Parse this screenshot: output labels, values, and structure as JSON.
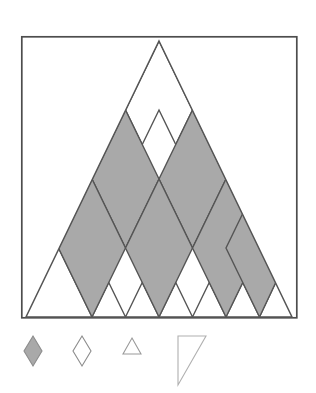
{
  "figure": {
    "type": "geometric-diagram",
    "canvas": {
      "width": 316,
      "height": 393,
      "background": "#ffffff"
    },
    "colors": {
      "shaded_fill": "#a9a9a9",
      "open_fill": "#ffffff",
      "stroke": "#555555",
      "frame_stroke": "#4d4d4d",
      "legend_stroke": "#8c8c8c",
      "legend_shaded_fill": "#a9a9a9"
    },
    "frame": {
      "name": "outer-square-border",
      "x": 21,
      "y": 36,
      "width": 276,
      "height": 282,
      "stroke_width": 1.6
    },
    "triangle": {
      "name": "large-triangle",
      "apex": {
        "x": 159,
        "y": 41
      },
      "base_left": {
        "x": 26,
        "y": 317
      },
      "base_right": {
        "x": 292,
        "y": 317
      },
      "rows": 4,
      "stroke_width": 1.3
    },
    "rows": [
      {
        "index": 1,
        "label": "row-1",
        "cells": [
          {
            "id": "r1c1",
            "kind": "up-triangle",
            "state": "open"
          }
        ]
      },
      {
        "index": 2,
        "label": "row-2",
        "cells": [
          {
            "id": "r2c1",
            "kind": "rhombus",
            "state": "shaded"
          },
          {
            "id": "r2c2",
            "kind": "rhombus",
            "state": "shaded"
          }
        ]
      },
      {
        "index": 3,
        "label": "row-3",
        "cells": [
          {
            "id": "r3c1",
            "kind": "rhombus",
            "state": "open"
          },
          {
            "id": "r3c2",
            "kind": "rhombus",
            "state": "open"
          },
          {
            "id": "r3c3",
            "kind": "rhombus",
            "state": "open"
          }
        ]
      },
      {
        "index": 4,
        "label": "row-4",
        "cells": [
          {
            "id": "r4c1",
            "kind": "rhombus",
            "state": "shaded"
          },
          {
            "id": "r4c2",
            "kind": "rhombus",
            "state": "shaded"
          },
          {
            "id": "r4c3",
            "kind": "rhombus",
            "state": "shaded"
          },
          {
            "id": "r4c4",
            "kind": "rhombus",
            "state": "shaded"
          }
        ]
      }
    ],
    "shaded_cell_count": 6,
    "open_cell_count": 4
  },
  "legend": {
    "name": "shape-legend",
    "item_count": 4,
    "items": [
      {
        "id": "legend-1",
        "shape": "rhombus-filled",
        "fill": "#a9a9a9",
        "stroke": "#8c8c8c",
        "label": ""
      },
      {
        "id": "legend-2",
        "shape": "rhombus-outline",
        "fill": "none",
        "stroke": "#8c8c8c",
        "label": ""
      },
      {
        "id": "legend-3",
        "shape": "triangle-outline",
        "fill": "none",
        "stroke": "#9a9a9a",
        "label": ""
      },
      {
        "id": "legend-4",
        "shape": "right-triangle-outline",
        "fill": "none",
        "stroke": "#b0b0b0",
        "label": ""
      }
    ]
  }
}
